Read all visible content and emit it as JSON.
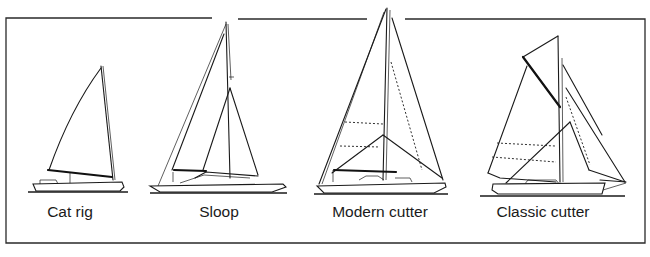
{
  "diagram": {
    "kind": "sailboat rig types comparison",
    "colors": {
      "line": "#1a1a1a",
      "background": "#ffffff"
    },
    "boats": [
      {
        "id": "cat-rig",
        "label": "Cat rig",
        "label_x": 70
      },
      {
        "id": "sloop",
        "label": "Sloop",
        "label_x": 219
      },
      {
        "id": "modern-cutter",
        "label": "Modern cutter",
        "label_x": 380
      },
      {
        "id": "classic-cutter",
        "label": "Classic cutter",
        "label_x": 543
      }
    ]
  }
}
